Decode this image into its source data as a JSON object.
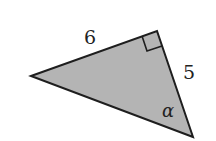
{
  "figure": {
    "type": "right-triangle",
    "fill_color": "#b4b4b4",
    "stroke_color": "#1e1e1e",
    "vertices": {
      "left": [
        31,
        76
      ],
      "top": [
        157,
        31
      ],
      "bottom": [
        193,
        137
      ]
    },
    "labels": {
      "hypotenuse_side": "6",
      "short_side": "5",
      "angle": "α"
    },
    "right_angle_at": "top"
  }
}
